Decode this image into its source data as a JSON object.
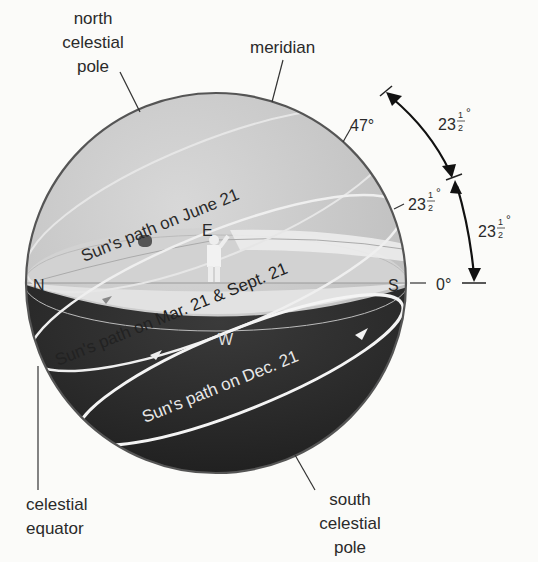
{
  "diagram": {
    "type": "celestial-sphere",
    "labels": {
      "north_pole": [
        "north",
        "celestial",
        "pole"
      ],
      "meridian": "meridian",
      "south_pole": [
        "south",
        "celestial",
        "pole"
      ],
      "celestial_equator": [
        "celestial",
        "equator"
      ]
    },
    "directions": {
      "north": "N",
      "south": "S",
      "east": "E",
      "west": "W"
    },
    "angles": {
      "a47": "47°",
      "a23_inner": "23",
      "a0": "0°",
      "arc_upper": "23",
      "arc_lower": "23",
      "fraction_num": "1",
      "fraction_den": "2",
      "degree": "°"
    },
    "paths": {
      "june": "Sun's path on June 21",
      "equinox": "Sun's path on Mar. 21 & Sept. 21",
      "december": "Sun's path on Dec. 21"
    },
    "colors": {
      "sky": "#c9c9c9",
      "sky_light": "#dcdcdc",
      "ground_light": "#e4e4e4",
      "below_horizon": "#2b2b2b",
      "outline": "#555555",
      "path_line": "#f4f4f4"
    }
  }
}
